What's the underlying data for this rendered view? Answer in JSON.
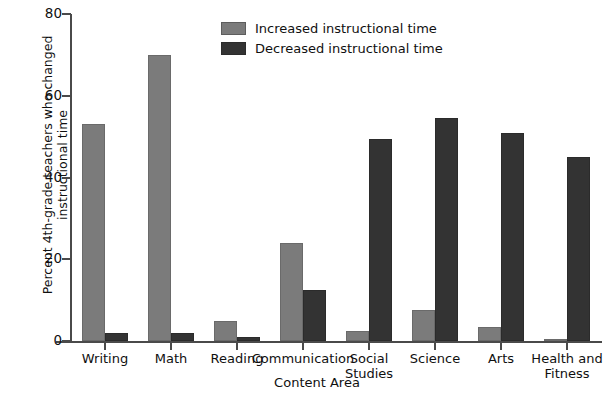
{
  "chart_data": {
    "type": "bar",
    "title": "",
    "xlabel": "Content Area",
    "ylabel": "Percent 4th-grade teachers who changed instructional time",
    "ylabel_line1": "Percent 4th-grade teachers who changed",
    "ylabel_line2": "instructional time",
    "ylim": [
      0,
      80
    ],
    "yticks": [
      0,
      20,
      40,
      60,
      80
    ],
    "ytick_labels": [
      "0",
      "20",
      "40",
      "60",
      "80"
    ],
    "grid": false,
    "legend_position": "top-center",
    "categories": [
      "Writing",
      "Math",
      "Reading",
      "Communication",
      "Social Studies",
      "Science",
      "Arts",
      "Health and Fitness"
    ],
    "category_lines": [
      [
        "Writing"
      ],
      [
        "Math"
      ],
      [
        "Reading"
      ],
      [
        "Communication"
      ],
      [
        "Social",
        "Studies"
      ],
      [
        "Science"
      ],
      [
        "Arts"
      ],
      [
        "Health and",
        "Fitness"
      ]
    ],
    "series": [
      {
        "name": "Increased instructional time",
        "color": "#7b7b7b",
        "values": [
          53,
          70,
          5,
          24,
          2.5,
          7.5,
          3.5,
          0.5
        ]
      },
      {
        "name": "Decreased instructional time",
        "color": "#333333",
        "values": [
          2,
          2,
          1,
          12.5,
          49.5,
          54.5,
          51,
          45
        ]
      }
    ]
  },
  "legend": {
    "items": [
      {
        "label": "Increased instructional time",
        "swatch": "light"
      },
      {
        "label": "Decreased instructional time",
        "swatch": "dark"
      }
    ]
  },
  "colors": {
    "increased": "#7b7b7b",
    "decreased": "#333333",
    "axis": "#4a4a4a",
    "background": "#ffffff",
    "text": "#101010"
  }
}
